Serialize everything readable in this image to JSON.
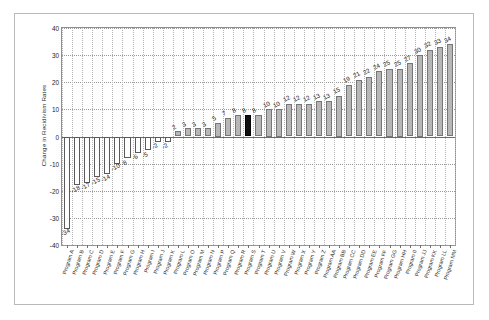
{
  "chart_data": {
    "type": "bar",
    "title": "",
    "xlabel": "",
    "ylabel": "Change in Recidivism Rates",
    "ylim": [
      -40,
      40
    ],
    "yticks": [
      40,
      30,
      20,
      10,
      0,
      -10,
      -20,
      -30,
      -40
    ],
    "grid": true,
    "legend": null,
    "data_labels_shown": true,
    "highlight_color": "#111111",
    "bar_color": "#b7b7b7",
    "negative_bar_color": "#ffffff",
    "categories": [
      "Program A",
      "Program B",
      "Program C",
      "Program D",
      "Program E",
      "Program F",
      "Program G",
      "Program H",
      "Program I",
      "Program J",
      "Program K",
      "Program L",
      "Program O",
      "Program M",
      "Program N",
      "Program P",
      "Program Q",
      "Program R",
      "Program S",
      "Program T",
      "Program U",
      "Program V",
      "Program W",
      "Program X",
      "Program Y",
      "Program Z",
      "Program AA",
      "Program BB",
      "Program CC",
      "Program DD",
      "Program EE",
      "Program FF",
      "Program GG",
      "Program HH",
      "Program II",
      "Program JJ",
      "Program KK",
      "Program LL",
      "Program MM"
    ],
    "values": [
      -34,
      -18,
      -17,
      -15,
      -14,
      -10,
      -8,
      -6,
      -5,
      -2,
      -2,
      2,
      3,
      3,
      3,
      5,
      7,
      8,
      8,
      8,
      10,
      10,
      12,
      12,
      12,
      13,
      13,
      15,
      19,
      21,
      22,
      24,
      25,
      25,
      27,
      30,
      32,
      33,
      34
    ],
    "highlighted_index": 18,
    "highlighted_category": "Program S",
    "highlighted_value": 8
  }
}
